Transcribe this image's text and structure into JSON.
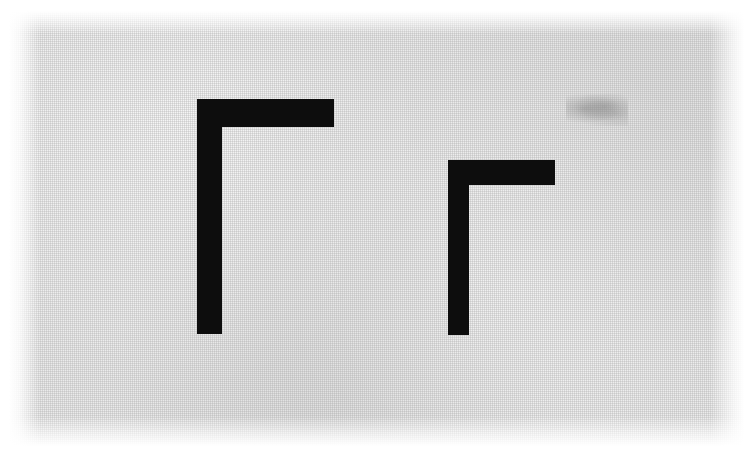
{
  "scene": {
    "title": "Two right-angle (gamma) figures on scanned gray paper",
    "background_color": "#eaeaea",
    "page_margin_color": "#ffffff",
    "ink_color": "#0d0d0d",
    "canvas": {
      "width": 754,
      "height": 462
    }
  },
  "figures": [
    {
      "name": "large-gamma",
      "label": "Γ",
      "orientation": "corner-top-left",
      "bar": {
        "x": 197,
        "y": 99,
        "width": 137,
        "height": 28
      },
      "stem": {
        "x": 197,
        "y": 99,
        "width": 25,
        "height": 235
      },
      "total_width": 137,
      "total_height": 235,
      "stroke_width": 26
    },
    {
      "name": "small-gamma",
      "label": "Γ",
      "orientation": "corner-top-left",
      "bar": {
        "x": 448,
        "y": 160,
        "width": 107,
        "height": 25
      },
      "stem": {
        "x": 448,
        "y": 160,
        "width": 21,
        "height": 175
      },
      "total_width": 107,
      "total_height": 175,
      "stroke_width": 23
    }
  ],
  "marks": [
    {
      "name": "pencil-smudge",
      "x": 566,
      "y": 94,
      "width": 62,
      "height": 32,
      "color": "#787878"
    }
  ]
}
